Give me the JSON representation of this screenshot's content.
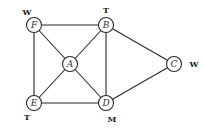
{
  "diagram": {
    "type": "graph",
    "nodes": [
      {
        "id": "F",
        "label": "F",
        "x": 34,
        "y": 25,
        "color_label": "W",
        "cx": 27,
        "cy": 12
      },
      {
        "id": "B",
        "label": "B",
        "x": 106,
        "y": 25,
        "color_label": "T",
        "cx": 106,
        "cy": 10
      },
      {
        "id": "A",
        "label": "A",
        "x": 70,
        "y": 64,
        "color_label": "",
        "cx": 0,
        "cy": 0
      },
      {
        "id": "C",
        "label": "C",
        "x": 174,
        "y": 64,
        "color_label": "W",
        "cx": 194,
        "cy": 64
      },
      {
        "id": "E",
        "label": "E",
        "x": 34,
        "y": 103,
        "color_label": "T",
        "cx": 27,
        "cy": 117
      },
      {
        "id": "D",
        "label": "D",
        "x": 106,
        "y": 103,
        "color_label": "M",
        "cx": 112,
        "cy": 119
      }
    ],
    "edges": [
      [
        "F",
        "B"
      ],
      [
        "F",
        "A"
      ],
      [
        "F",
        "E"
      ],
      [
        "B",
        "A"
      ],
      [
        "B",
        "D"
      ],
      [
        "B",
        "C"
      ],
      [
        "A",
        "E"
      ],
      [
        "A",
        "D"
      ],
      [
        "E",
        "D"
      ],
      [
        "D",
        "C"
      ]
    ],
    "node_radius": 7.5
  }
}
